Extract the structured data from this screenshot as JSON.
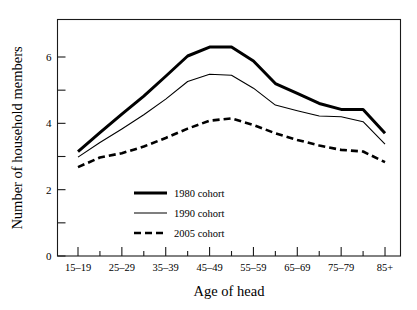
{
  "figure": {
    "background": "#ffffff",
    "ink_color": "#000000"
  },
  "chart_data": {
    "type": "line",
    "title": "",
    "xlabel": "Age of head",
    "ylabel": "Number of household members",
    "categories": [
      "15–19",
      "20–24",
      "25–29",
      "30–34",
      "35–39",
      "40–44",
      "45–49",
      "50–54",
      "55–59",
      "60–64",
      "65–69",
      "70–74",
      "75–79",
      "80–84",
      "85+"
    ],
    "tick_labels": [
      "15–19",
      "",
      "25–29",
      "",
      "35–39",
      "",
      "45–49",
      "",
      "55–59",
      "",
      "65–69",
      "",
      "75–79",
      "",
      "85+"
    ],
    "labeled_ticks": [
      "15–19",
      "25–29",
      "35–39",
      "45–49",
      "55–59",
      "65–69",
      "75–79",
      "85+"
    ],
    "ylim": [
      0,
      6.8
    ],
    "xlim": [
      0,
      16
    ],
    "yticks_major": [
      0,
      2,
      4,
      6
    ],
    "yticks_minor": [
      1,
      3,
      5
    ],
    "ytick_labels": [
      "0",
      "2",
      "4",
      "6"
    ],
    "grid": false,
    "legend_position": "center-left-inside",
    "series": [
      {
        "name": "1980 cohort",
        "style": "solid-thick",
        "stroke_width": 3.0,
        "dash": "none",
        "values": [
          3.15,
          3.72,
          4.28,
          4.82,
          5.42,
          6.03,
          6.3,
          6.3,
          5.88,
          5.2,
          4.9,
          4.6,
          4.42,
          4.42,
          3.7
        ]
      },
      {
        "name": "1990 cohort",
        "style": "solid-thin",
        "stroke_width": 1.1,
        "dash": "none",
        "values": [
          2.98,
          3.42,
          3.83,
          4.26,
          4.73,
          5.26,
          5.48,
          5.45,
          5.06,
          4.55,
          4.38,
          4.22,
          4.2,
          4.05,
          3.37
        ]
      },
      {
        "name": "2005 cohort",
        "style": "dashed",
        "stroke_width": 2.6,
        "dash": "7,4",
        "values": [
          2.68,
          2.97,
          3.1,
          3.3,
          3.56,
          3.84,
          4.08,
          4.15,
          3.95,
          3.7,
          3.5,
          3.33,
          3.2,
          3.15,
          2.83
        ]
      }
    ]
  },
  "legend": {
    "items": [
      {
        "label": "1980 cohort",
        "style": "solid-thick"
      },
      {
        "label": "1990 cohort",
        "style": "solid-thin"
      },
      {
        "label": "2005 cohort",
        "style": "dashed"
      }
    ]
  }
}
